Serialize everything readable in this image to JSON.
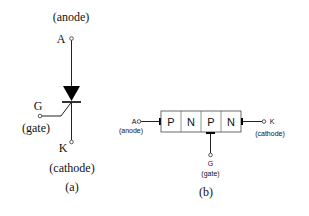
{
  "diagram_a": {
    "caption": "(a)",
    "anode_label": "(anode)",
    "anode_letter": "A",
    "gate_letter": "G",
    "gate_label": "(gate)",
    "cathode_letter": "K",
    "cathode_label": "(cathode)",
    "symbol": "thyristor-scr-icon"
  },
  "diagram_b": {
    "caption": "(b)",
    "anode_letter": "A",
    "anode_label": "(anode)",
    "cathode_letter": "K",
    "cathode_label": "(cathode)",
    "gate_letter": "G",
    "gate_label": "(gate)",
    "layers": [
      "P",
      "N",
      "P",
      "N"
    ]
  }
}
